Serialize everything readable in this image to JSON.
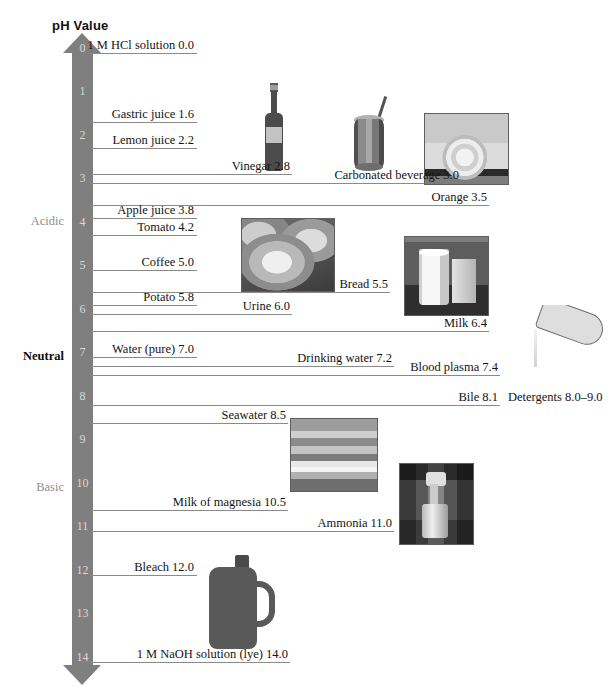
{
  "title": "pH Value",
  "axis": {
    "min": 0,
    "max": 14,
    "tick_labels": [
      "0",
      "1",
      "2",
      "3",
      "4",
      "5",
      "6",
      "7",
      "8",
      "9",
      "10",
      "11",
      "12",
      "13",
      "14"
    ],
    "color": "#7f7f7f",
    "tick_label_color": "#d9d9d9"
  },
  "regions": [
    {
      "name": "acidic",
      "label": "Acidic",
      "ph_center": 3.9,
      "color": "#8f8f8f"
    },
    {
      "name": "neutral",
      "label": "Neutral",
      "ph_center": 7.0,
      "color": "#0d0d0d"
    },
    {
      "name": "basic",
      "label": "Basic",
      "ph_center": 10.0,
      "color": "#8f8f8f"
    }
  ],
  "chart_data": {
    "type": "bar",
    "title": "pH Value",
    "xlabel": "",
    "ylabel": "pH Value",
    "ylim": [
      0,
      14
    ],
    "grid": false,
    "legend": "none",
    "orientation": "vertical-scale",
    "categories": [
      "1 M HCl solution",
      "Gastric juice",
      "Lemon juice",
      "Vinegar",
      "Carbonated beverage",
      "Orange",
      "Apple juice",
      "Tomato",
      "Coffee",
      "Bread",
      "Potato",
      "Urine",
      "Milk",
      "Water (pure)",
      "Drinking water",
      "Blood plasma",
      "Bile",
      "Detergents",
      "Seawater",
      "Milk of magnesia",
      "Ammonia",
      "Bleach",
      "1 M NaOH solution (lye)"
    ],
    "values": [
      0.0,
      1.6,
      2.2,
      2.8,
      3.0,
      3.5,
      3.8,
      4.2,
      5.0,
      5.5,
      5.8,
      6.0,
      6.4,
      7.0,
      7.2,
      7.4,
      8.1,
      8.5,
      8.5,
      10.5,
      11.0,
      12.0,
      14.0
    ]
  },
  "entries": [
    {
      "name": "hcl",
      "label": "1 M HCl solution 0.0",
      "ph": 0.0,
      "line_right": 197,
      "text_right": 194,
      "text_align": "right"
    },
    {
      "name": "gastric-juice",
      "label": "Gastric juice 1.6",
      "ph": 1.6,
      "line_right": 197,
      "text_right": 194,
      "text_align": "right"
    },
    {
      "name": "lemon-juice",
      "label": "Lemon juice 2.2",
      "ph": 2.2,
      "line_right": 197,
      "text_right": 194,
      "text_align": "right"
    },
    {
      "name": "vinegar",
      "label": "Vinegar 2.8",
      "ph": 2.8,
      "line_right": 292,
      "text_right": 290,
      "text_align": "right"
    },
    {
      "name": "carbonated-beverage",
      "label": "Carbonated beverage 3.0",
      "ph": 3.0,
      "line_right": 462,
      "text_right": 459,
      "text_align": "right"
    },
    {
      "name": "orange",
      "label": "Orange 3.5",
      "ph": 3.5,
      "line_right": 489,
      "text_right": 487,
      "text_align": "right"
    },
    {
      "name": "apple-juice",
      "label": "Apple juice 3.8",
      "ph": 3.8,
      "line_right": 197,
      "text_right": 194,
      "text_align": "right"
    },
    {
      "name": "tomato",
      "label": "Tomato 4.2",
      "ph": 4.2,
      "line_right": 197,
      "text_right": 194,
      "text_align": "right"
    },
    {
      "name": "coffee",
      "label": "Coffee 5.0",
      "ph": 5.0,
      "line_right": 197,
      "text_right": 194,
      "text_align": "right"
    },
    {
      "name": "bread",
      "label": "Bread 5.5",
      "ph": 5.5,
      "line_right": 390,
      "text_right": 388,
      "text_align": "right"
    },
    {
      "name": "potato",
      "label": "Potato 5.8",
      "ph": 5.8,
      "line_right": 197,
      "text_right": 194,
      "text_align": "right"
    },
    {
      "name": "urine",
      "label": "Urine 6.0",
      "ph": 6.0,
      "line_right": 292,
      "text_right": 290,
      "text_align": "right"
    },
    {
      "name": "milk",
      "label": "Milk 6.4",
      "ph": 6.4,
      "line_right": 489,
      "text_right": 487,
      "text_align": "right"
    },
    {
      "name": "water-pure",
      "label": "Water (pure) 7.0",
      "ph": 7.0,
      "line_right": 197,
      "text_right": 194,
      "text_align": "right"
    },
    {
      "name": "drinking-water",
      "label": "Drinking water 7.2",
      "ph": 7.2,
      "line_right": 394,
      "text_right": 392,
      "text_align": "right"
    },
    {
      "name": "blood-plasma",
      "label": "Blood plasma 7.4",
      "ph": 7.4,
      "line_right": 500,
      "text_right": 498,
      "text_align": "right"
    },
    {
      "name": "bile",
      "label": "Bile 8.1",
      "ph": 8.1,
      "line_right": 500,
      "text_right": 498,
      "text_align": "right"
    },
    {
      "name": "detergents",
      "label": "Detergents 8.0–9.0",
      "ph": 8.1,
      "line_right": 0,
      "text_right": 0,
      "text_align": "none",
      "text_left": 508,
      "no_line": true
    },
    {
      "name": "seawater",
      "label": "Seawater 8.5",
      "ph": 8.5,
      "line_right": 288,
      "text_right": 286,
      "text_align": "right"
    },
    {
      "name": "milk-of-magnesia",
      "label": "Milk of magnesia 10.5",
      "ph": 10.5,
      "line_right": 288,
      "text_right": 286,
      "text_align": "right"
    },
    {
      "name": "ammonia",
      "label": "Ammonia 11.0",
      "ph": 11.0,
      "line_right": 394,
      "text_right": 392,
      "text_align": "right"
    },
    {
      "name": "bleach",
      "label": "Bleach 12.0",
      "ph": 12.0,
      "line_right": 197,
      "text_right": 194,
      "text_align": "right"
    },
    {
      "name": "naoh",
      "label": "1 M NaOH solution (lye) 14.0",
      "ph": 14.0,
      "line_right": 290,
      "text_right": 288,
      "text_align": "right"
    }
  ],
  "photos": [
    {
      "name": "vinegar-bottle-photo",
      "alt": "vinegar bottle",
      "x": 261,
      "y": 83,
      "w": 26,
      "h": 88
    },
    {
      "name": "carbonated-beverage-photo",
      "alt": "soda can with straw",
      "x": 350,
      "y": 93,
      "w": 38,
      "h": 80
    },
    {
      "name": "orange-photo",
      "alt": "orange slice",
      "x": 424,
      "y": 113,
      "w": 83,
      "h": 70
    },
    {
      "name": "bread-photo",
      "alt": "loaf of bread",
      "x": 241,
      "y": 218,
      "w": 92,
      "h": 72
    },
    {
      "name": "milk-photo",
      "alt": "glass of milk",
      "x": 404,
      "y": 236,
      "w": 83,
      "h": 78
    },
    {
      "name": "detergent-pour-photo",
      "alt": "pouring detergent",
      "x": 508,
      "y": 305,
      "w": 96,
      "h": 62
    },
    {
      "name": "seawater-photo",
      "alt": "seawater waves",
      "x": 290,
      "y": 418,
      "w": 86,
      "h": 72
    },
    {
      "name": "ammonia-spray-photo",
      "alt": "spray bottle",
      "x": 399,
      "y": 463,
      "w": 73,
      "h": 80
    },
    {
      "name": "bleach-jug-photo",
      "alt": "bleach jug",
      "x": 203,
      "y": 553,
      "w": 73,
      "h": 98
    }
  ]
}
